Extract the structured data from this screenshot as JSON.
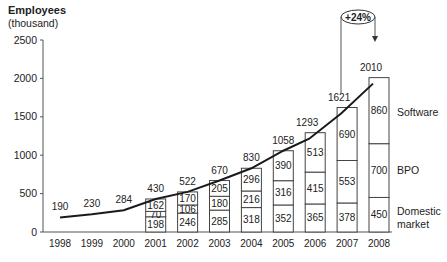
{
  "chart_data": {
    "type": "bar",
    "subtype": "stacked bar with total line",
    "title": "",
    "ylabel": "Employees",
    "ylabel_unit": "(thousand)",
    "xlabel": "",
    "ylim": [
      0,
      2500
    ],
    "yticks": [
      0,
      500,
      1000,
      1500,
      2000,
      2500
    ],
    "grid": false,
    "categories": [
      "1998",
      "1999",
      "2000",
      "2001",
      "2002",
      "2003",
      "2004",
      "2005",
      "2006",
      "2007",
      "2008"
    ],
    "totals": [
      190,
      230,
      284,
      430,
      522,
      670,
      830,
      1058,
      1293,
      1621,
      2010
    ],
    "series": [
      {
        "name": "Domestic market",
        "values": [
          null,
          null,
          null,
          198,
          246,
          285,
          318,
          352,
          365,
          378,
          450
        ]
      },
      {
        "name": "BPO",
        "values": [
          null,
          null,
          null,
          70,
          106,
          180,
          216,
          316,
          415,
          553,
          700
        ]
      },
      {
        "name": "Software",
        "values": [
          null,
          null,
          null,
          162,
          170,
          205,
          296,
          390,
          513,
          690,
          860
        ]
      }
    ],
    "legend": [
      "Software",
      "BPO",
      "Domestic market"
    ],
    "legend_position": "right, inline labels",
    "annotations": [
      {
        "text": "+24%",
        "from": "2007",
        "to": "2008"
      }
    ]
  },
  "labels": {
    "ylabel": "Employees",
    "yunit": "(thousand)",
    "growth": "+24%",
    "legend_software": "Software",
    "legend_bpo": "BPO",
    "legend_domestic_1": "Domestic",
    "legend_domestic_2": "market"
  },
  "colors": {
    "axis": "#555555",
    "line": "#1a1a1a",
    "bar_fill": "#ffffff",
    "bar_stroke": "#444444",
    "text": "#222222"
  }
}
